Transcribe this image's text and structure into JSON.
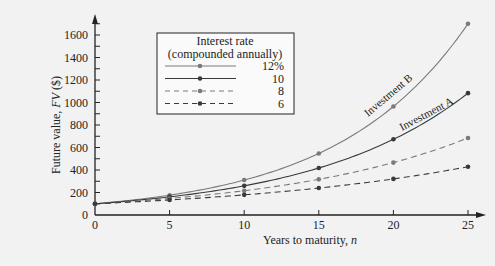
{
  "chart_data": {
    "type": "line",
    "title": "",
    "xlabel": "Years to maturity, n",
    "ylabel": "Future value, FV ($)",
    "x": [
      0,
      5,
      10,
      15,
      20,
      25
    ],
    "xticks": [
      "0",
      "5",
      "10",
      "15",
      "20",
      "25"
    ],
    "yticks": [
      "0",
      "200",
      "400",
      "600",
      "800",
      "1000",
      "1200",
      "1400",
      "1600"
    ],
    "xlim": [
      0,
      25
    ],
    "ylim": [
      0,
      1600
    ],
    "grid": false,
    "legend": {
      "title_line1": "Interest rate",
      "title_line2": "(compounded annually)",
      "position": "upper-left"
    },
    "series": [
      {
        "name": "12%",
        "style": "solid",
        "color": "#7a7a7a",
        "values": [
          100,
          176,
          311,
          547,
          965,
          1700
        ]
      },
      {
        "name": "10",
        "style": "solid",
        "color": "#3a3a3a",
        "values": [
          100,
          161,
          259,
          418,
          673,
          1083
        ]
      },
      {
        "name": "8",
        "style": "dashed",
        "color": "#7a7a7a",
        "values": [
          100,
          147,
          216,
          317,
          466,
          685
        ]
      },
      {
        "name": "6",
        "style": "dashed",
        "color": "#3a3a3a",
        "values": [
          100,
          134,
          179,
          240,
          321,
          429
        ]
      }
    ],
    "annotations": [
      {
        "text": "Investment B",
        "series": "12%"
      },
      {
        "text": "Investment A",
        "series": "10"
      }
    ]
  }
}
